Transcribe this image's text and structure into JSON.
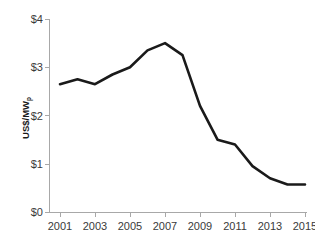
{
  "chart_data": {
    "type": "line",
    "title": "",
    "subtitle": "",
    "xlabel": "",
    "ylabel": "US$/MW",
    "ylabel_subscript": "p",
    "x": [
      2001,
      2002,
      2003,
      2004,
      2005,
      2006,
      2007,
      2008,
      2009,
      2010,
      2011,
      2012,
      2013,
      2014,
      2015
    ],
    "values": [
      2.65,
      2.75,
      2.65,
      2.85,
      3.0,
      3.35,
      3.5,
      3.25,
      2.2,
      1.5,
      1.4,
      0.95,
      0.7,
      0.57,
      0.57
    ],
    "series": [
      {
        "name": "US$/MWp",
        "values": [
          2.65,
          2.75,
          2.65,
          2.85,
          3.0,
          3.35,
          3.5,
          3.25,
          2.2,
          1.5,
          1.4,
          0.95,
          0.7,
          0.57,
          0.57
        ]
      }
    ],
    "xlim": [
      2001,
      2015
    ],
    "ylim": [
      0,
      4
    ],
    "x_tick_labels": [
      "2001",
      "2003",
      "2005",
      "2007",
      "2009",
      "2011",
      "2013",
      "2015"
    ],
    "x_tick_values": [
      2001,
      2003,
      2005,
      2007,
      2009,
      2011,
      2013,
      2015
    ],
    "y_tick_labels": [
      "$0",
      "$1",
      "$2",
      "$3",
      "$4"
    ],
    "y_tick_values": [
      0,
      1,
      2,
      3,
      4
    ],
    "grid": false,
    "legend": false,
    "line_color": "#1a1a1a",
    "axis_color": "#a8a8a8"
  }
}
